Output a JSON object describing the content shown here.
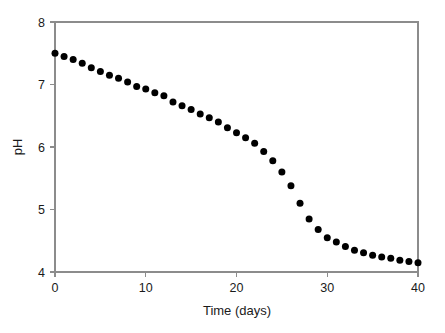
{
  "chart_data": {
    "type": "scatter",
    "title": "",
    "subtitle": "",
    "xlabel": "Time (days)",
    "ylabel": "pH",
    "xlim": [
      0,
      40
    ],
    "ylim": [
      4,
      8
    ],
    "xticks": [
      0,
      10,
      20,
      30,
      40
    ],
    "xtick_labels": [
      "0",
      "10",
      "20",
      "30",
      "40"
    ],
    "yticks": [
      4,
      5,
      6,
      7,
      8
    ],
    "ytick_labels": [
      "4",
      "5",
      "6",
      "7",
      "8"
    ],
    "grid": false,
    "legend": null,
    "marker": "filled-circle",
    "marker_color": "#000000",
    "marker_size_px": 7,
    "frame": "box",
    "frame_color": "#8c8c8c",
    "x": [
      0,
      1,
      2,
      3,
      4,
      5,
      6,
      7,
      8,
      9,
      10,
      11,
      12,
      13,
      14,
      15,
      16,
      17,
      18,
      19,
      20,
      21,
      22,
      23,
      24,
      25,
      26,
      27,
      28,
      29,
      30,
      31,
      32,
      33,
      34,
      35,
      36,
      37,
      38,
      39,
      40
    ],
    "values": [
      7.5,
      7.45,
      7.4,
      7.34,
      7.27,
      7.21,
      7.15,
      7.1,
      7.04,
      6.97,
      6.93,
      6.87,
      6.82,
      6.72,
      6.66,
      6.6,
      6.53,
      6.47,
      6.4,
      6.31,
      6.23,
      6.15,
      6.06,
      5.93,
      5.78,
      5.6,
      5.38,
      5.1,
      4.85,
      4.68,
      4.55,
      4.48,
      4.41,
      4.35,
      4.31,
      4.27,
      4.24,
      4.22,
      4.19,
      4.17,
      4.15
    ],
    "series_name": "pH"
  },
  "axes": {
    "x_axis_label": "Time (days)",
    "y_axis_label": "pH"
  }
}
